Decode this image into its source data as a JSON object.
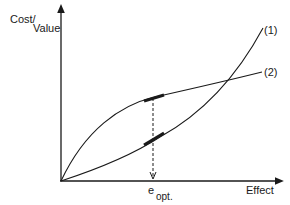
{
  "diagram": {
    "y_axis_label_part1": "Cost/",
    "y_axis_label_part2": "Value",
    "x_axis_label": "Effect",
    "optimum_label_main": "e",
    "optimum_label_sub": "opt.",
    "curves": [
      {
        "id": "1",
        "label": "(1)",
        "shape": "convex (increasing, accelerating)"
      },
      {
        "id": "2",
        "label": "(2)",
        "shape": "concave (increasing, saturating)"
      }
    ],
    "colors": {
      "line": "#1a1a1a",
      "background": "#ffffff"
    }
  }
}
